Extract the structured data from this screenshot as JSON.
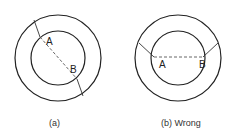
{
  "figures": [
    {
      "id": "a",
      "caption": "(a)",
      "point_a": "A",
      "point_b": "B",
      "description": "Two concentric circles; a diagonal line crosses the ring, with dashed segment A–B passing through the inner circle along the same line"
    },
    {
      "id": "b",
      "caption": "(b) Wrong",
      "point_a": "A",
      "point_b": "B",
      "description": "Two concentric circles; lines from outer ring meet inner circle at A and B, connected by a horizontal dashed chord"
    }
  ],
  "colors": {
    "stroke": "#222222",
    "dashed": "#555555",
    "background": "#ffffff"
  }
}
